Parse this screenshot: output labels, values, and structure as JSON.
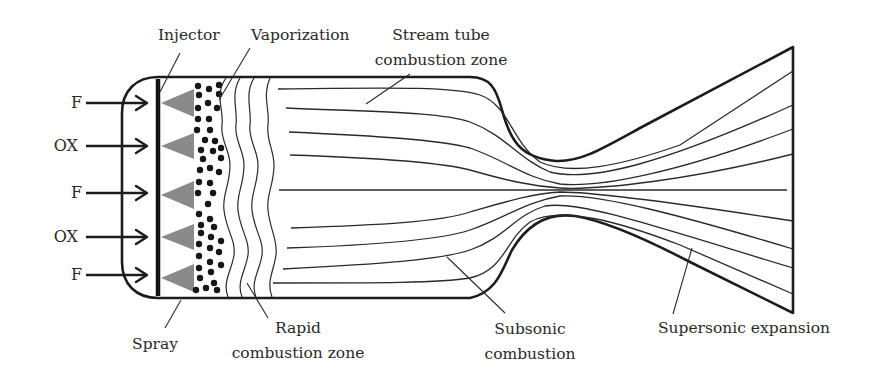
{
  "diagram": {
    "type": "rocket combustion chamber and nozzle flow schematic",
    "inlet_labels": [
      "F",
      "OX",
      "F",
      "OX",
      "F"
    ],
    "labels": {
      "injector": "Injector",
      "vaporization": "Vaporization",
      "stream_tube_line1": "Stream tube",
      "stream_tube_line2": "combustion zone",
      "spray": "Spray",
      "rapid_line1": "Rapid",
      "rapid_line2": "combustion zone",
      "subsonic_line1": "Subsonic",
      "subsonic_line2": "combustion",
      "supersonic": "Supersonic expansion"
    },
    "colors": {
      "line": "#1c1c1c",
      "spray_fill": "#8a8a8a",
      "droplet": "#161616",
      "background": "#ffffff"
    }
  }
}
